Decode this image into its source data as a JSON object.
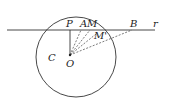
{
  "diagram": {
    "type": "geometry",
    "labels": {
      "P": "P",
      "A": "A",
      "M": "M",
      "M_prime": "M'",
      "B": "B",
      "r": "r",
      "C": "C",
      "O": "O"
    },
    "circle": {
      "name": "C",
      "center": "O"
    },
    "line": {
      "name": "r"
    },
    "segments": [
      {
        "from": "O",
        "to": "P",
        "style": "solid"
      },
      {
        "from": "O",
        "to": "A",
        "style": "dashed"
      },
      {
        "from": "O",
        "to": "M",
        "style": "dashed"
      },
      {
        "from": "O",
        "to": "M'",
        "style": "dashed"
      },
      {
        "from": "O",
        "to": "B",
        "style": "dashed"
      }
    ],
    "colors": {
      "stroke": "#333333",
      "background": "#ffffff"
    }
  }
}
